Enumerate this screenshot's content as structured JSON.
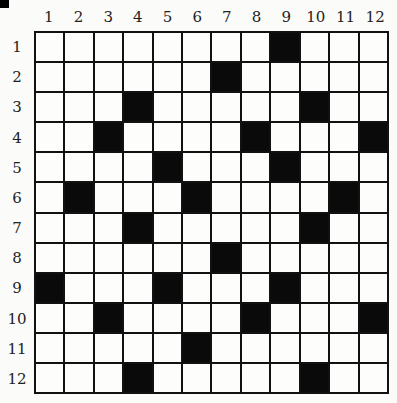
{
  "puzzle": {
    "type": "crossword-grid",
    "rows": 12,
    "cols": 12,
    "column_labels": [
      "1",
      "2",
      "3",
      "4",
      "5",
      "6",
      "7",
      "8",
      "9",
      "10",
      "11",
      "12"
    ],
    "row_labels": [
      "1",
      "2",
      "3",
      "4",
      "5",
      "6",
      "7",
      "8",
      "9",
      "10",
      "11",
      "12"
    ],
    "black_cells": {
      "1": [
        9
      ],
      "2": [
        7
      ],
      "3": [
        4,
        10
      ],
      "4": [
        3,
        8,
        12
      ],
      "5": [
        5,
        9
      ],
      "6": [
        2,
        6,
        11
      ],
      "7": [
        4,
        10
      ],
      "8": [
        7
      ],
      "9": [
        1,
        5,
        9
      ],
      "10": [
        3,
        8,
        12
      ],
      "11": [
        6
      ],
      "12": [
        4,
        10
      ]
    },
    "colors": {
      "black": "#0a0a0a",
      "white": "#fdfdfb",
      "line": "#111111"
    }
  }
}
